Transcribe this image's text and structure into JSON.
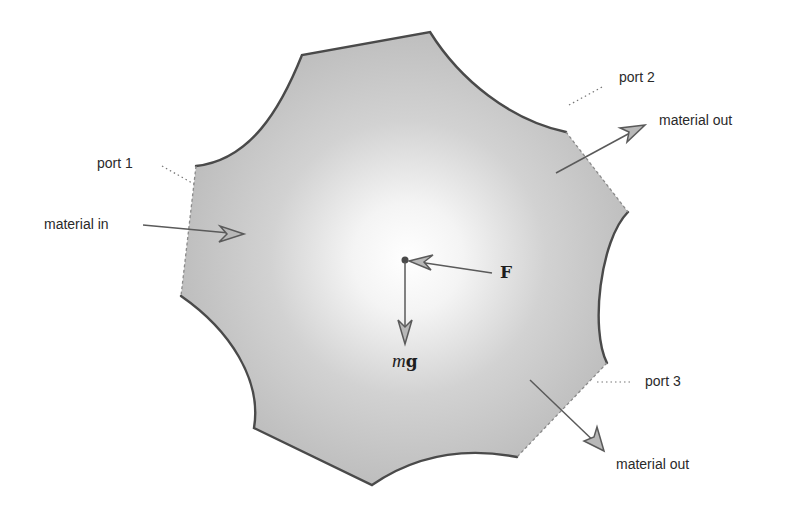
{
  "diagram": {
    "type": "control-volume",
    "colors": {
      "fill_outer": "#bdbdbd",
      "fill_center": "#ffffff",
      "boundary": "#4a4a4a",
      "arrow": "#5a5a5a",
      "arrow_head_fill": "#b8b8b8",
      "text": "#2a2a2a"
    },
    "ports": [
      {
        "id": "port-1",
        "label": "port 1",
        "flow_label": "material in",
        "direction": "in"
      },
      {
        "id": "port-2",
        "label": "port 2",
        "flow_label": "material out",
        "direction": "out"
      },
      {
        "id": "port-3",
        "label": "port 3",
        "flow_label": "material out",
        "direction": "out"
      }
    ],
    "forces": [
      {
        "id": "force-F",
        "symbol": "F",
        "style": "bold"
      },
      {
        "id": "force-mg",
        "symbol_italic": "m",
        "symbol_bold": "g"
      }
    ]
  }
}
